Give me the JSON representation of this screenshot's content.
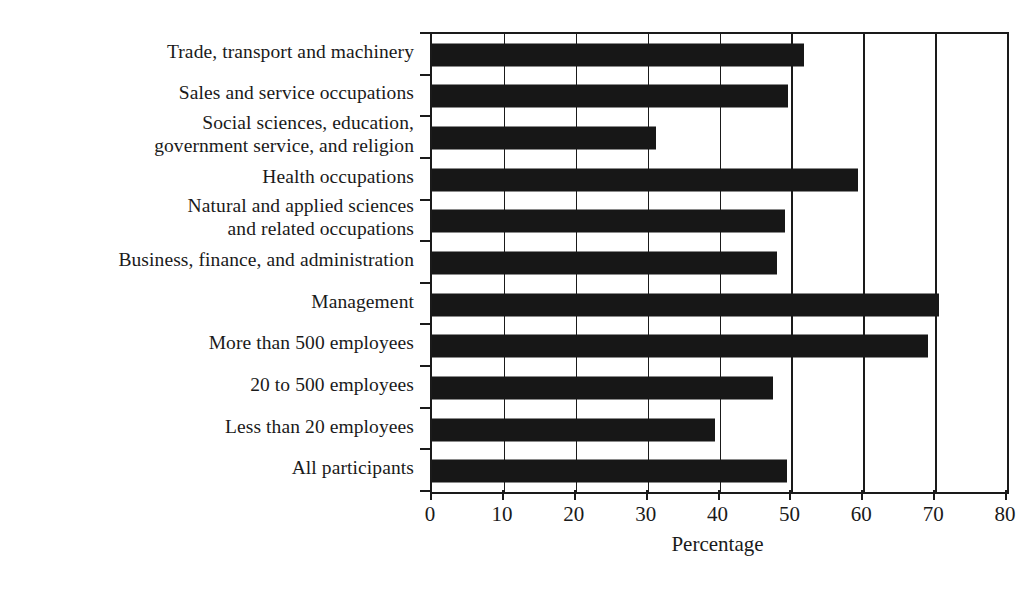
{
  "chart_data": {
    "type": "bar",
    "orientation": "horizontal",
    "title": "",
    "xlabel": "Percentage",
    "ylabel": "",
    "xlim": [
      0,
      80
    ],
    "xticks": [
      0,
      10,
      20,
      30,
      40,
      50,
      60,
      70,
      80
    ],
    "grid": true,
    "grid_axis": "x",
    "legend": false,
    "bar_color": "#171717",
    "categories": [
      "Trade, transport and machinery",
      "Sales and service occupations",
      "Social sciences, education,\ngovernment service, and religion",
      "Health occupations",
      "Natural and applied sciences\nand related occupations",
      "Business, finance, and administration",
      "Management",
      "More than 500 employees",
      "20 to 500 employees",
      "Less than 20 employees",
      "All participants"
    ],
    "values": [
      51.8,
      49.5,
      31.2,
      59.2,
      49.1,
      48.0,
      70.5,
      69.0,
      47.4,
      39.4,
      49.4
    ]
  },
  "axis": {
    "x_title": "Percentage",
    "tick_labels": [
      "0",
      "10",
      "20",
      "30",
      "40",
      "50",
      "60",
      "70",
      "80"
    ]
  },
  "caption": {
    "text": ""
  }
}
